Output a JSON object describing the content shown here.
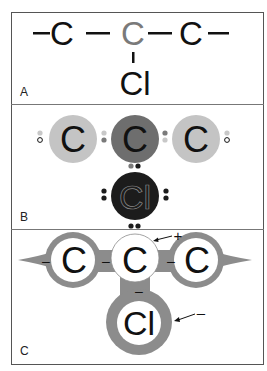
{
  "figure": {
    "panels": [
      {
        "id": "A",
        "label": "A",
        "description": "structural formula",
        "bond_symbol": "—",
        "atoms": [
          {
            "symbol": "C",
            "color": "#111111"
          },
          {
            "symbol": "C",
            "color": "#7a7a7a"
          },
          {
            "symbol": "C",
            "color": "#111111"
          },
          {
            "symbol": "Cl",
            "color": "#111111"
          }
        ]
      },
      {
        "id": "B",
        "label": "B",
        "description": "electron-dot model",
        "atoms": [
          {
            "symbol": "C",
            "fill": "#c4c4c4",
            "text_color": "#111111"
          },
          {
            "symbol": "C",
            "fill": "#6e6e6e",
            "text_color": "#111111"
          },
          {
            "symbol": "C",
            "fill": "#c4c4c4",
            "text_color": "#111111"
          },
          {
            "symbol": "Cl",
            "fill": "#1c1c1c",
            "text_color": "#1c1c1c",
            "outline": "#8a8a8a"
          }
        ],
        "electron_colors": {
          "light": "#c8c8c8",
          "medium": "#7a7a7a",
          "dark": "#1c1c1c",
          "open": "#ffffff"
        }
      },
      {
        "id": "C",
        "label": "C",
        "description": "electron cloud / polarity model",
        "cloud_color": "#8c8c8c",
        "atoms": [
          {
            "symbol": "C"
          },
          {
            "symbol": "C"
          },
          {
            "symbol": "C"
          },
          {
            "symbol": "Cl"
          }
        ],
        "charges": {
          "left_c": "–",
          "bond_left": "–",
          "bond_right": "–",
          "below_center": "–"
        },
        "annotations": [
          {
            "target": "center-carbon",
            "sign": "+"
          },
          {
            "target": "chlorine",
            "sign": "–"
          }
        ]
      }
    ]
  }
}
